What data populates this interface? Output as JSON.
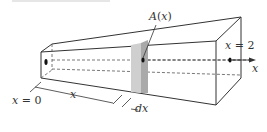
{
  "diagram": {
    "type": "solid-cross-section",
    "labels": {
      "area": "A(x)",
      "start": "x = 0",
      "end": "x = 2",
      "distance": "x",
      "thickness": "dx",
      "axis": "x"
    },
    "colors": {
      "line": "#333333",
      "slab_front": "#a9a9a9",
      "slab_side": "#cfcfcf",
      "background": "#ffffff"
    }
  }
}
